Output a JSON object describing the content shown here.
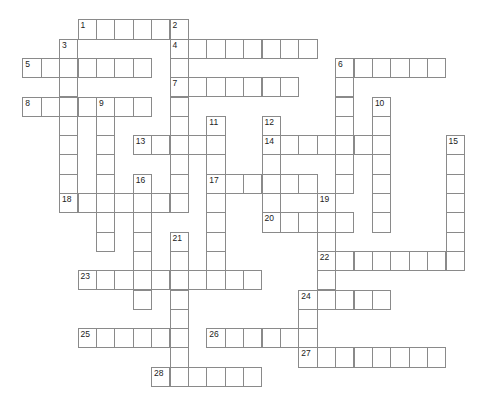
{
  "puzzle": {
    "type": "crossword",
    "grid": {
      "origin_x": 22.3,
      "origin_y": 19.3,
      "cell_w": 18.4,
      "cell_h": 19.3
    },
    "entries": [
      {
        "number": "1",
        "dir": "across",
        "row": 0,
        "col": 3,
        "length": 6
      },
      {
        "number": "2",
        "dir": "down",
        "row": 0,
        "col": 8,
        "length": 10
      },
      {
        "number": "3",
        "dir": "down",
        "row": 1,
        "col": 2,
        "length": 9
      },
      {
        "number": "4",
        "dir": "across",
        "row": 1,
        "col": 8,
        "length": 8
      },
      {
        "number": "5",
        "dir": "across",
        "row": 2,
        "col": 0,
        "length": 7
      },
      {
        "number": "6",
        "dir": "across",
        "row": 2,
        "col": 17,
        "length": 6
      },
      {
        "number": "6",
        "dir": "down",
        "row": 2,
        "col": 17,
        "length": 7
      },
      {
        "number": "7",
        "dir": "across",
        "row": 3,
        "col": 8,
        "length": 7
      },
      {
        "number": "8",
        "dir": "across",
        "row": 4,
        "col": 0,
        "length": 7
      },
      {
        "number": "9",
        "dir": "down",
        "row": 4,
        "col": 4,
        "length": 8
      },
      {
        "number": "10",
        "dir": "down",
        "row": 4,
        "col": 19,
        "length": 7
      },
      {
        "number": "11",
        "dir": "down",
        "row": 5,
        "col": 10,
        "length": 9
      },
      {
        "number": "12",
        "dir": "down",
        "row": 5,
        "col": 13,
        "length": 6
      },
      {
        "number": "13",
        "dir": "across",
        "row": 6,
        "col": 6,
        "length": 5
      },
      {
        "number": "14",
        "dir": "across",
        "row": 6,
        "col": 13,
        "length": 7
      },
      {
        "number": "15",
        "dir": "down",
        "row": 6,
        "col": 23,
        "length": 7
      },
      {
        "number": "16",
        "dir": "down",
        "row": 8,
        "col": 6,
        "length": 7
      },
      {
        "number": "17",
        "dir": "across",
        "row": 8,
        "col": 10,
        "length": 6
      },
      {
        "number": "18",
        "dir": "across",
        "row": 9,
        "col": 2,
        "length": 7
      },
      {
        "number": "19",
        "dir": "down",
        "row": 9,
        "col": 16,
        "length": 6
      },
      {
        "number": "20",
        "dir": "across",
        "row": 10,
        "col": 13,
        "length": 5
      },
      {
        "number": "21",
        "dir": "down",
        "row": 11,
        "col": 8,
        "length": 8
      },
      {
        "number": "22",
        "dir": "across",
        "row": 12,
        "col": 16,
        "length": 8
      },
      {
        "number": "23",
        "dir": "across",
        "row": 13,
        "col": 3,
        "length": 10
      },
      {
        "number": "24",
        "dir": "across",
        "row": 14,
        "col": 15,
        "length": 5
      },
      {
        "number": "24",
        "dir": "down",
        "row": 14,
        "col": 15,
        "length": 4
      },
      {
        "number": "25",
        "dir": "across",
        "row": 16,
        "col": 3,
        "length": 6
      },
      {
        "number": "26",
        "dir": "across",
        "row": 16,
        "col": 10,
        "length": 6
      },
      {
        "number": "27",
        "dir": "across",
        "row": 17,
        "col": 15,
        "length": 8
      },
      {
        "number": "28",
        "dir": "across",
        "row": 18,
        "col": 7,
        "length": 6
      }
    ]
  }
}
